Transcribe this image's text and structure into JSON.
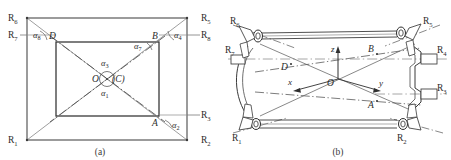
{
  "figure": {
    "panels": [
      {
        "id": "panel-a",
        "caption": "(a)",
        "description": "planar-schematic-top-view",
        "joint_labels": [
          {
            "name": "R",
            "sub": "1",
            "x": 10,
            "y": 139
          },
          {
            "name": "R",
            "sub": "2",
            "x": 205,
            "y": 139
          },
          {
            "name": "R",
            "sub": "3",
            "x": 205,
            "y": 112
          },
          {
            "name": "R",
            "sub": "4",
            "x": 205,
            "y": 33
          },
          {
            "name": "R",
            "sub": "5",
            "x": 205,
            "y": 13
          },
          {
            "name": "R",
            "sub": "6",
            "x": 10,
            "y": 13
          },
          {
            "name": "R",
            "sub": "7",
            "x": 10,
            "y": 33
          },
          {
            "name": "R",
            "sub": "8",
            "x": 205,
            "y": 33
          }
        ],
        "angle_labels": [
          {
            "name": "α",
            "sub": "1"
          },
          {
            "name": "α",
            "sub": "2"
          },
          {
            "name": "α",
            "sub": "3"
          },
          {
            "name": "α",
            "sub": "4"
          },
          {
            "name": "α",
            "sub": "7"
          },
          {
            "name": "α",
            "sub": "8"
          }
        ],
        "point_labels": [
          "A",
          "B",
          "C",
          "D",
          "O"
        ],
        "center_label": "O",
        "center_paren_label": "(C)"
      },
      {
        "id": "panel-b",
        "caption": "(b)",
        "description": "three-dimensional-mechanism-view",
        "joint_labels": [
          {
            "name": "R",
            "sub": "1"
          },
          {
            "name": "R",
            "sub": "2"
          },
          {
            "name": "R",
            "sub": "3"
          },
          {
            "name": "R",
            "sub": "4"
          },
          {
            "name": "R",
            "sub": "5"
          },
          {
            "name": "R",
            "sub": "6"
          },
          {
            "name": "R",
            "sub": "7"
          }
        ],
        "axis_labels": [
          "x",
          "y",
          "z"
        ],
        "point_labels": [
          "A",
          "B",
          "D",
          "O"
        ]
      }
    ],
    "colors": {
      "line": "#3a3a3a",
      "line_light": "#8a8a8a",
      "fill": "#ffffff",
      "text": "#2b2b2b"
    }
  }
}
